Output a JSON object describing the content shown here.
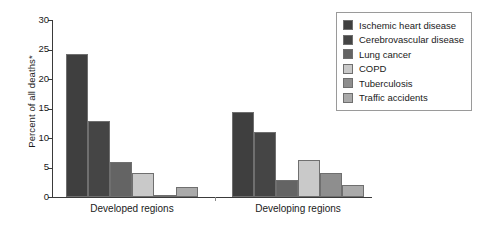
{
  "chart_data": {
    "type": "bar",
    "title": "",
    "subtitle": "",
    "xlabel": "",
    "ylabel": "Percent of all deaths*",
    "ylim": [
      0,
      30
    ],
    "yticks": [
      0,
      5,
      10,
      15,
      20,
      25,
      30
    ],
    "ytick_labels": [
      "0",
      "5",
      "10",
      "15",
      "20",
      "25",
      "30"
    ],
    "grid": false,
    "legend_position": "top-right",
    "categories": [
      "Developed regions",
      "Developing regions"
    ],
    "series": [
      {
        "name": "Ischemic heart disease",
        "color": "#3f3f3f",
        "values": [
          24.2,
          14.4
        ]
      },
      {
        "name": "Cerebrovascular disease",
        "color": "#454545",
        "values": [
          12.8,
          11.0
        ]
      },
      {
        "name": "Lung cancer",
        "color": "#646464",
        "values": [
          5.9,
          2.9
        ]
      },
      {
        "name": "COPD",
        "color": "#c9c9c9",
        "values": [
          4.1,
          6.3
        ]
      },
      {
        "name": "Tuberculosis",
        "color": "#8e8e8e",
        "values": [
          0.4,
          4.1
        ]
      },
      {
        "name": "Traffic accidents",
        "color": "#aaaaaa",
        "values": [
          1.7,
          2.1
        ]
      }
    ]
  },
  "axis": {
    "y_label": "Percent of all deaths*"
  },
  "legend": {
    "items": [
      {
        "label": "Ischemic heart disease"
      },
      {
        "label": "Cerebrovascular disease"
      },
      {
        "label": "Lung cancer"
      },
      {
        "label": "COPD"
      },
      {
        "label": "Tuberculosis"
      },
      {
        "label": "Traffic accidents"
      }
    ]
  }
}
